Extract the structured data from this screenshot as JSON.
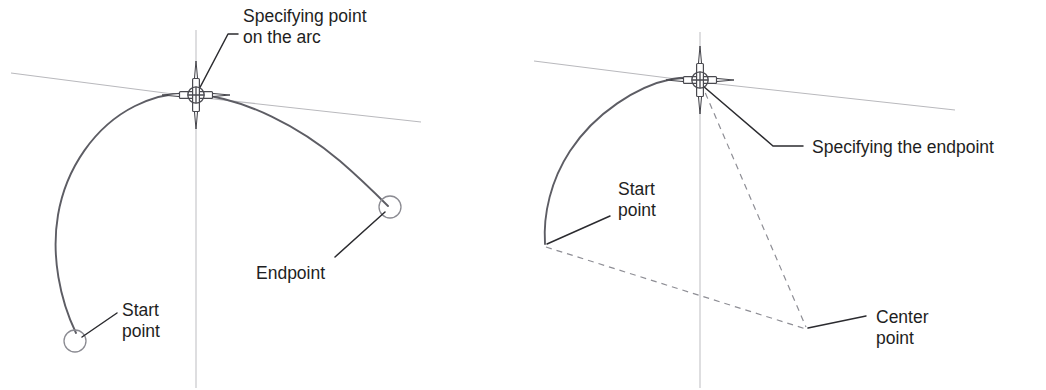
{
  "figure": {
    "background_color": "#ffffff",
    "colors": {
      "arc_stroke": "#5d5d64",
      "construction_stroke": "#b9b9bd",
      "axis_stroke": "#c3c3c7",
      "dashed_stroke": "#8e8e95",
      "leader_stroke": "#2b2b2f",
      "marker_stroke": "#8b8b92",
      "text_fill": "#1e1e22"
    }
  },
  "panels": [
    {
      "id": "left",
      "name": "arc-start-end-point-on-arc",
      "annotations": [
        {
          "id": "specifying-point-on-arc",
          "lines": [
            "Specifying point",
            "on the arc"
          ],
          "text_x": 243,
          "text_y": 17,
          "leader": "M 196 95 L 228 34 L 238 34"
        },
        {
          "id": "endpoint",
          "lines": [
            "Endpoint"
          ],
          "text_x": 256,
          "text_y": 274,
          "leader": "M 385 212 L 335 257"
        },
        {
          "id": "start-point",
          "lines": [
            "Start",
            "point"
          ],
          "text_x": 122,
          "text_y": 311,
          "leader": "M 82 337 L 117 313"
        }
      ],
      "markers": [
        {
          "id": "start-point-marker",
          "cx": 75,
          "cy": 341,
          "r": 11
        },
        {
          "id": "endpoint-marker",
          "cx": 390,
          "cy": 207,
          "r": 11
        }
      ],
      "cursor": {
        "id": "crosshair-cursor",
        "cx": 196,
        "cy": 95
      }
    },
    {
      "id": "right",
      "name": "arc-start-end-center",
      "annotations": [
        {
          "id": "specifying-the-endpoint",
          "lines": [
            "Specifying the endpoint"
          ],
          "text_x": 812,
          "text_y": 148,
          "leader": "M 703 86 L 773 146 L 803 146"
        },
        {
          "id": "start-point",
          "lines": [
            "Start",
            "point"
          ],
          "text_x": 618,
          "text_y": 190,
          "leader": "M 547 244 L 610 216"
        },
        {
          "id": "center-point",
          "lines": [
            "Center",
            "point"
          ],
          "text_x": 876,
          "text_y": 318,
          "leader": "M 808 328 L 866 316"
        }
      ],
      "markers": [],
      "cursor": {
        "id": "crosshair-cursor",
        "cx": 700,
        "cy": 80
      }
    }
  ]
}
